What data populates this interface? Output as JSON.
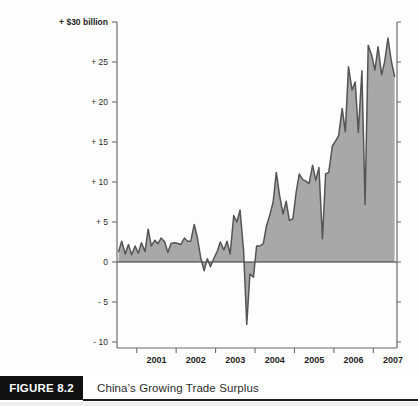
{
  "figure": {
    "number_label": "FIGURE 8.2",
    "caption": "China’s Growing Trade Surplus"
  },
  "chart_data": {
    "type": "area",
    "title": "China’s Growing Trade Surplus",
    "subtitle": "",
    "xlabel": "",
    "ylabel": "+ $30 billion",
    "unit_label": "+ $30 billion",
    "grid": false,
    "legend": "none",
    "zero_line": 0,
    "xlim": [
      2000.5,
      2007.6
    ],
    "ylim": [
      -10,
      30
    ],
    "yticks": [
      30,
      25,
      20,
      15,
      10,
      5,
      0,
      -5,
      -10
    ],
    "ytick_labels": [
      "+ $30 billion",
      "+ 25",
      "+ 20",
      "+ 15",
      "+ 10",
      "+ 5",
      "0",
      "- 5",
      "- 10"
    ],
    "xticks": [
      2001,
      2002,
      2003,
      2004,
      2005,
      2006,
      2007
    ],
    "xtick_labels": [
      "2001",
      "2002",
      "2003",
      "2004",
      "2005",
      "2006",
      "2007"
    ],
    "series": [
      {
        "name": "China monthly trade balance (US$ billions)",
        "fill_color": "#a8a8a8",
        "line_color": "#555555",
        "x": [
          2000.54,
          2000.62,
          2000.71,
          2000.79,
          2000.87,
          2000.96,
          2001.04,
          2001.12,
          2001.21,
          2001.29,
          2001.37,
          2001.46,
          2001.54,
          2001.62,
          2001.71,
          2001.79,
          2001.87,
          2001.96,
          2002.04,
          2002.12,
          2002.21,
          2002.29,
          2002.37,
          2002.46,
          2002.54,
          2002.62,
          2002.71,
          2002.79,
          2002.87,
          2002.96,
          2003.04,
          2003.12,
          2003.21,
          2003.29,
          2003.37,
          2003.46,
          2003.54,
          2003.62,
          2003.71,
          2003.79,
          2003.87,
          2003.96,
          2004.04,
          2004.12,
          2004.21,
          2004.29,
          2004.37,
          2004.46,
          2004.54,
          2004.62,
          2004.71,
          2004.79,
          2004.87,
          2004.96,
          2005.04,
          2005.12,
          2005.21,
          2005.29,
          2005.37,
          2005.46,
          2005.54,
          2005.62,
          2005.71,
          2005.79,
          2005.87,
          2005.96,
          2006.04,
          2006.12,
          2006.21,
          2006.29,
          2006.37,
          2006.46,
          2006.54,
          2006.62,
          2006.71,
          2006.79,
          2006.87,
          2006.96,
          2007.04,
          2007.12,
          2007.21,
          2007.29,
          2007.37,
          2007.46,
          2007.54
        ],
        "values": [
          1.3,
          2.6,
          1.0,
          2.2,
          0.9,
          2.0,
          1.1,
          2.4,
          1.3,
          4.1,
          2.0,
          2.7,
          2.3,
          3.0,
          2.5,
          1.2,
          2.3,
          2.4,
          2.3,
          2.2,
          3.0,
          2.6,
          2.6,
          4.7,
          3.0,
          0.6,
          -1.1,
          0.4,
          -0.6,
          0.5,
          1.3,
          2.5,
          1.5,
          2.6,
          1.0,
          5.8,
          5.0,
          6.5,
          1.4,
          -7.8,
          -1.5,
          -1.9,
          2.0,
          2.0,
          2.3,
          4.5,
          5.8,
          7.5,
          11.2,
          8.4,
          6.0,
          7.6,
          5.2,
          5.4,
          8.6,
          11.0,
          10.3,
          10.1,
          9.8,
          12.1,
          10.2,
          11.8,
          2.9,
          11.0,
          11.2,
          14.5,
          15.1,
          15.8,
          19.2,
          16.3,
          24.4,
          21.5,
          22.5,
          16.2,
          23.9,
          7.2,
          27.1,
          25.8,
          24.0,
          26.9,
          23.4,
          25.1,
          28.0,
          25.0,
          23.2
        ]
      }
    ],
    "annotations": []
  },
  "axis": {
    "y_unit_label": "+ $30 billion",
    "tick_labels_y": [
      "+ 25",
      "+ 20",
      "+ 15",
      "+ 10",
      "+ 5",
      "0",
      "- 5",
      "- 10"
    ],
    "tick_labels_x": [
      "2001",
      "2002",
      "2003",
      "2004",
      "2005",
      "2006",
      "2007"
    ]
  },
  "colors": {
    "area_fill": "#a8a8a8",
    "area_line": "#555555",
    "axis": "#6b6b6b",
    "zero_line": "#333333",
    "figure_box_bg": "#111111",
    "figure_box_text": "#ffffff",
    "caption_text": "#2a2a2a"
  }
}
